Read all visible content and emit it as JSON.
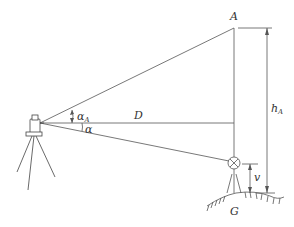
{
  "diagram": {
    "type": "trigonometric-height-measurement",
    "labels": {
      "point_a": "A",
      "distance": "D",
      "alpha_a": "α",
      "alpha_a_sub": "A",
      "alpha": "α",
      "height_h": "h",
      "height_h_sub": "A",
      "target_height": "v",
      "ground_point": "G"
    },
    "colors": {
      "line": "#555555",
      "text": "#333333",
      "background": "#ffffff"
    }
  }
}
